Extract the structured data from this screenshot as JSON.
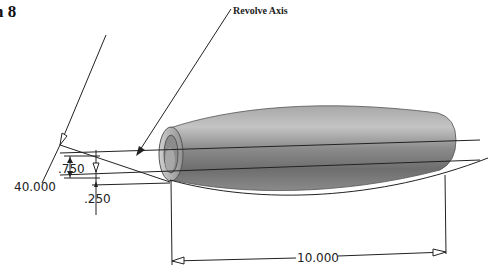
{
  "figure": {
    "number_fragment": "n 8",
    "callout_label": "Revolve Axis"
  },
  "dimensions": {
    "angle": "40.000",
    "offset_upper": ".750",
    "offset_lower": ".250",
    "length": "10.000"
  },
  "part": {
    "shape": "hollow barrel (revolved tube)",
    "fill_colors": [
      "#9a9a9a",
      "#b8b8b8",
      "#7a7a7a",
      "#5e5e5e"
    ]
  },
  "colors": {
    "line": "#2a2a2a",
    "text": "#222222",
    "background": "#ffffff"
  }
}
